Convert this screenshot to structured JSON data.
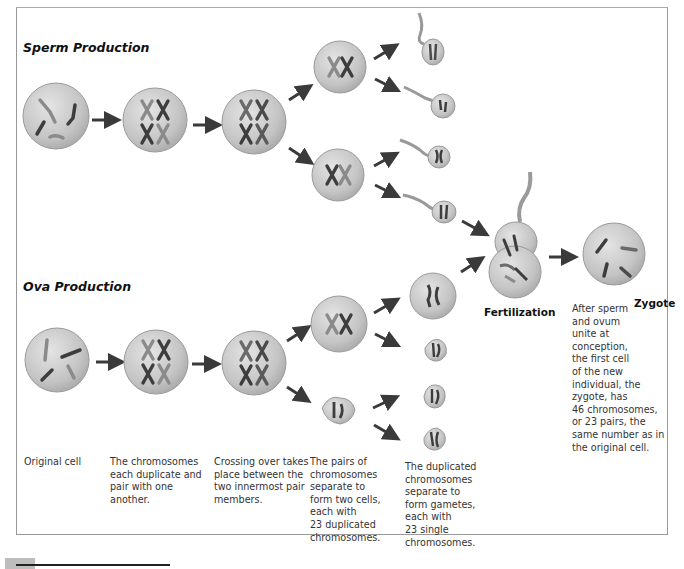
{
  "figure": {
    "sections": {
      "sperm": {
        "title": "Sperm Production"
      },
      "ova": {
        "title": "Ova Production"
      }
    },
    "labels": {
      "fertilization": "Fertilization",
      "zygote": "Zygote"
    },
    "captions": {
      "original_cell": [
        "Original cell"
      ],
      "duplicate": [
        "The chromosomes",
        "each duplicate and",
        "pair with one",
        "another."
      ],
      "crossing_over": [
        "Crossing over takes",
        "place between the",
        "two innermost pair",
        "members."
      ],
      "pairs_separate": [
        "The pairs of",
        "chromosomes",
        "separate to",
        "form two cells,",
        "each with",
        "23 duplicated",
        "chromosomes."
      ],
      "gametes": [
        "The duplicated",
        "chromosomes",
        "separate to",
        "form gametes,",
        "each with",
        "23 single",
        "chromosomes."
      ],
      "zygote": [
        "After sperm",
        "and ovum",
        "unite at",
        "conception,",
        "the first cell",
        "of the new",
        "individual, the",
        "zygote, has",
        "46 chromosomes,",
        "or 23 pairs, the",
        "same number as in",
        "the original cell."
      ]
    },
    "colors": {
      "cell_fill": "#c9c9c9",
      "cell_edge": "#9a9a9a",
      "chromosome_dark": "#3d3d3d",
      "chromosome_light": "#8a8a8a",
      "arrow": "#3a3a3a",
      "frame_border": "#999999"
    },
    "stages": [
      "Original cell",
      "Duplication",
      "Crossing over",
      "Meiosis I",
      "Meiosis II (gametes)",
      "Fertilization",
      "Zygote"
    ]
  }
}
